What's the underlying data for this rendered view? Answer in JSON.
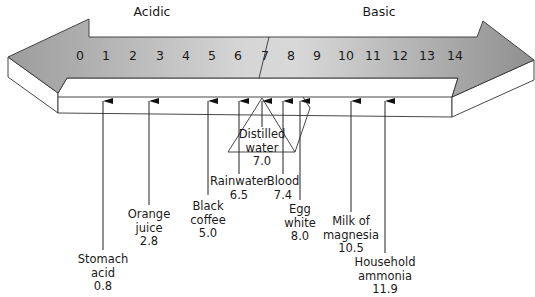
{
  "regions": {
    "acidic": "Acidic",
    "basic": "Basic"
  },
  "scale": {
    "ticks": [
      "0",
      "1",
      "2",
      "3",
      "4",
      "5",
      "6",
      "7",
      "8",
      "9",
      "10",
      "11",
      "12",
      "13",
      "14"
    ],
    "tick_x": [
      80,
      106,
      133,
      160,
      186,
      212,
      238,
      265,
      291,
      317,
      346,
      373,
      400,
      427,
      455
    ]
  },
  "colors": {
    "arrow_gradient_left": "#9a9a9a",
    "arrow_gradient_mid": "#d8d8d8",
    "arrow_gradient_right": "#8e8e8e",
    "outline": "#333333",
    "extrusion": "#ffffff"
  },
  "substances": [
    {
      "name_line1": "Stomach",
      "name_line2": "acid",
      "ph": "0.8",
      "x": 103,
      "line_bottom": 250,
      "label_top": 253
    },
    {
      "name_line1": "Orange",
      "name_line2": "juice",
      "ph": "2.8",
      "x": 149,
      "line_bottom": 205,
      "label_top": 208
    },
    {
      "name_line1": "Black",
      "name_line2": "coffee",
      "ph": "5.0",
      "x": 208,
      "line_bottom": 195,
      "label_top": 200
    },
    {
      "name_line1": "Rainwater",
      "name_line2": "",
      "ph": "6.5",
      "x": 239,
      "line_bottom": 174,
      "label_top": 175
    },
    {
      "name_line1": "Distilled",
      "name_line2": "water",
      "ph": "7.0",
      "x": 262,
      "line_bottom": 127,
      "label_top": 128
    },
    {
      "name_line1": "Blood",
      "name_line2": "",
      "ph": "7.4",
      "x": 283,
      "line_bottom": 174,
      "label_top": 175
    },
    {
      "name_line1": "Egg",
      "name_line2": "white",
      "ph": "8.0",
      "x": 300,
      "line_bottom": 200,
      "label_top": 203
    },
    {
      "name_line1": "Milk of",
      "name_line2": "magnesia",
      "ph": "10.5",
      "x": 351,
      "line_bottom": 212,
      "label_top": 215
    },
    {
      "name_line1": "Household",
      "name_line2": "ammonia",
      "ph": "11.9",
      "x": 385,
      "line_bottom": 253,
      "label_top": 256
    }
  ],
  "chart_data": {
    "type": "number-line",
    "axis": {
      "min": 0,
      "max": 14,
      "ticks": [
        0,
        1,
        2,
        3,
        4,
        5,
        6,
        7,
        8,
        9,
        10,
        11,
        12,
        13,
        14
      ]
    },
    "regions": [
      {
        "label": "Acidic",
        "range": [
          0,
          7
        ]
      },
      {
        "label": "Basic",
        "range": [
          7,
          14
        ]
      }
    ],
    "points": [
      {
        "label": "Stomach acid",
        "value": 0.8
      },
      {
        "label": "Orange juice",
        "value": 2.8
      },
      {
        "label": "Black coffee",
        "value": 5.0
      },
      {
        "label": "Rainwater",
        "value": 6.5
      },
      {
        "label": "Distilled water",
        "value": 7.0
      },
      {
        "label": "Blood",
        "value": 7.4
      },
      {
        "label": "Egg white",
        "value": 8.0
      },
      {
        "label": "Milk of magnesia",
        "value": 10.5
      },
      {
        "label": "Household ammonia",
        "value": 11.9
      }
    ]
  }
}
